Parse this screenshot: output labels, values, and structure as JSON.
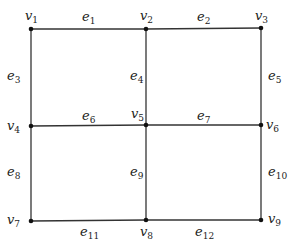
{
  "graph": {
    "vertices": [
      {
        "id": "v1",
        "base": "v",
        "sub": "1",
        "x": 31,
        "y": 29,
        "lx": 25,
        "ly": 20
      },
      {
        "id": "v2",
        "base": "v",
        "sub": "2",
        "x": 146,
        "y": 29,
        "lx": 140,
        "ly": 20
      },
      {
        "id": "v3",
        "base": "v",
        "sub": "3",
        "x": 261,
        "y": 28,
        "lx": 255,
        "ly": 20
      },
      {
        "id": "v4",
        "base": "v",
        "sub": "4",
        "x": 31,
        "y": 126,
        "lx": 7,
        "ly": 130
      },
      {
        "id": "v5",
        "base": "v",
        "sub": "5",
        "x": 146,
        "y": 125,
        "lx": 131,
        "ly": 118
      },
      {
        "id": "v6",
        "base": "v",
        "sub": "6",
        "x": 261,
        "y": 125,
        "lx": 266,
        "ly": 129
      },
      {
        "id": "v7",
        "base": "v",
        "sub": "7",
        "x": 31,
        "y": 221,
        "lx": 7,
        "ly": 224
      },
      {
        "id": "v8",
        "base": "v",
        "sub": "8",
        "x": 146,
        "y": 220,
        "lx": 140,
        "ly": 236
      },
      {
        "id": "v9",
        "base": "v",
        "sub": "9",
        "x": 261,
        "y": 220,
        "lx": 268,
        "ly": 223
      }
    ],
    "edges": [
      {
        "id": "e1",
        "base": "e",
        "sub": "1",
        "from": "v1",
        "to": "v2",
        "lx": 82,
        "ly": 21
      },
      {
        "id": "e2",
        "base": "e",
        "sub": "2",
        "from": "v2",
        "to": "v3",
        "lx": 197,
        "ly": 21
      },
      {
        "id": "e3",
        "base": "e",
        "sub": "3",
        "from": "v1",
        "to": "v4",
        "lx": 7,
        "ly": 80
      },
      {
        "id": "e4",
        "base": "e",
        "sub": "4",
        "from": "v2",
        "to": "v5",
        "lx": 130,
        "ly": 80
      },
      {
        "id": "e5",
        "base": "e",
        "sub": "5",
        "from": "v3",
        "to": "v6",
        "lx": 268,
        "ly": 80
      },
      {
        "id": "e6",
        "base": "e",
        "sub": "6",
        "from": "v4",
        "to": "v5",
        "lx": 82,
        "ly": 120
      },
      {
        "id": "e7",
        "base": "e",
        "sub": "7",
        "from": "v5",
        "to": "v6",
        "lx": 197,
        "ly": 120
      },
      {
        "id": "e8",
        "base": "e",
        "sub": "8",
        "from": "v4",
        "to": "v7",
        "lx": 7,
        "ly": 176
      },
      {
        "id": "e9",
        "base": "e",
        "sub": "9",
        "from": "v5",
        "to": "v8",
        "lx": 130,
        "ly": 176
      },
      {
        "id": "e10",
        "base": "e",
        "sub": "10",
        "from": "v6",
        "to": "v9",
        "lx": 268,
        "ly": 176
      },
      {
        "id": "e11",
        "base": "e",
        "sub": "11",
        "from": "v7",
        "to": "v8",
        "lx": 80,
        "ly": 236
      },
      {
        "id": "e12",
        "base": "e",
        "sub": "12",
        "from": "v8",
        "to": "v9",
        "lx": 195,
        "ly": 236
      }
    ]
  }
}
